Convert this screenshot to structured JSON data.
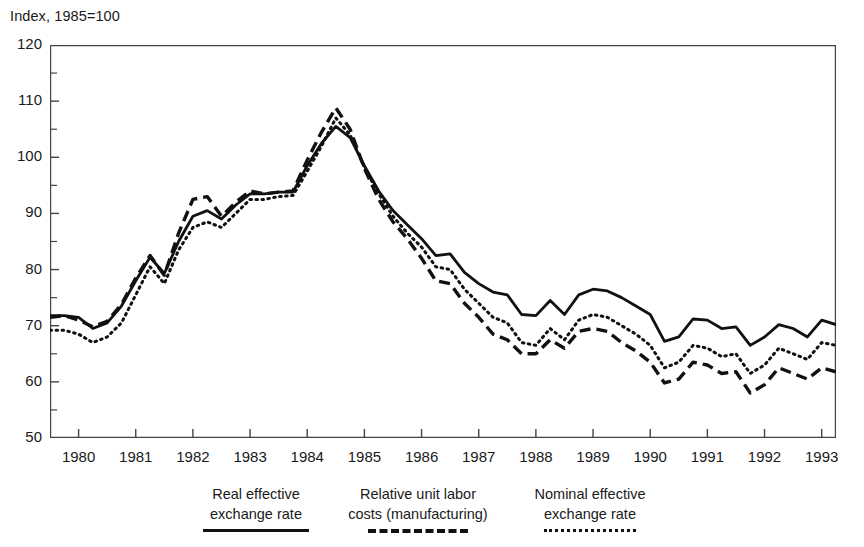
{
  "axis_title": "Index, 1985=100",
  "legend": [
    {
      "name": "real-effective-exchange-rate",
      "line1": "Real effective",
      "line2": "exchange rate",
      "style": "solid"
    },
    {
      "name": "relative-unit-labor-costs",
      "line1": "Relative unit labor",
      "line2": "costs (manufacturing)",
      "style": "dashed"
    },
    {
      "name": "nominal-effective-exchange-rate",
      "line1": "Nominal effective",
      "line2": "exchange rate",
      "style": "dotted"
    }
  ],
  "chart_data": {
    "type": "line",
    "title": "Index, 1985=100",
    "xlabel": "",
    "ylabel": "Index, 1985=100",
    "xlim": [
      1979.5,
      1993.25
    ],
    "ylim": [
      50,
      120
    ],
    "yticks": [
      50,
      60,
      70,
      80,
      90,
      100,
      110,
      120
    ],
    "yticks_minor": [
      55,
      65,
      75,
      85,
      95,
      105,
      115
    ],
    "xticks": [
      1980,
      1981,
      1982,
      1983,
      1984,
      1985,
      1986,
      1987,
      1988,
      1989,
      1990,
      1991,
      1992,
      1993
    ],
    "grid": false,
    "legend_position": "below",
    "frequency": "quarterly",
    "x": [
      1979.5,
      1979.75,
      1980.0,
      1980.25,
      1980.5,
      1980.75,
      1981.0,
      1981.25,
      1981.5,
      1981.75,
      1982.0,
      1982.25,
      1982.5,
      1982.75,
      1983.0,
      1983.25,
      1983.5,
      1983.75,
      1984.0,
      1984.25,
      1984.5,
      1984.75,
      1985.0,
      1985.25,
      1985.5,
      1985.75,
      1986.0,
      1986.25,
      1986.5,
      1986.75,
      1987.0,
      1987.25,
      1987.5,
      1987.75,
      1988.0,
      1988.25,
      1988.5,
      1988.75,
      1989.0,
      1989.25,
      1989.5,
      1989.75,
      1990.0,
      1990.25,
      1990.5,
      1990.75,
      1991.0,
      1991.25,
      1991.5,
      1991.75,
      1992.0,
      1992.25,
      1992.5,
      1992.75,
      1993.0,
      1993.25
    ],
    "series": [
      {
        "name": "Real effective exchange rate",
        "style": "solid",
        "color": "#111111",
        "values": [
          71.8,
          71.8,
          71.5,
          69.5,
          70.5,
          73.5,
          78.0,
          82.2,
          79.3,
          85.0,
          89.5,
          90.5,
          89.0,
          91.5,
          93.5,
          93.5,
          93.8,
          93.8,
          98.5,
          102.5,
          105.5,
          103.5,
          98.5,
          94.0,
          90.5,
          88.0,
          85.5,
          82.5,
          82.8,
          79.5,
          77.5,
          76.0,
          75.5,
          72.0,
          71.8,
          74.5,
          72.0,
          75.5,
          76.5,
          76.2,
          75.0,
          73.5,
          72.0,
          67.2,
          68.0,
          71.2,
          71.0,
          69.5,
          69.8,
          66.5,
          68.0,
          70.2,
          69.5,
          68.0,
          71.0,
          70.2
        ]
      },
      {
        "name": "Relative unit labor costs (manufacturing)",
        "style": "dashed",
        "color": "#111111",
        "values": [
          71.5,
          71.8,
          71.0,
          69.8,
          70.8,
          73.8,
          78.5,
          82.5,
          79.0,
          86.5,
          92.5,
          93.0,
          89.5,
          92.0,
          94.0,
          93.5,
          93.8,
          94.0,
          99.5,
          104.5,
          108.8,
          105.0,
          98.0,
          92.5,
          88.5,
          85.5,
          82.0,
          78.0,
          77.5,
          74.0,
          71.5,
          68.5,
          67.5,
          65.0,
          65.0,
          67.5,
          66.0,
          69.0,
          69.5,
          69.0,
          67.0,
          65.5,
          63.5,
          59.8,
          60.5,
          63.5,
          63.0,
          61.5,
          61.8,
          58.0,
          59.5,
          62.5,
          61.5,
          60.5,
          62.5,
          61.8
        ]
      },
      {
        "name": "Nominal effective exchange rate",
        "style": "dotted",
        "color": "#111111",
        "values": [
          69.2,
          69.2,
          68.5,
          67.0,
          68.0,
          70.5,
          75.5,
          80.5,
          77.5,
          83.5,
          87.5,
          88.5,
          87.5,
          90.0,
          92.5,
          92.5,
          93.0,
          93.2,
          97.5,
          102.0,
          107.0,
          104.0,
          98.2,
          93.5,
          89.5,
          86.5,
          84.0,
          80.5,
          80.0,
          76.5,
          74.0,
          71.5,
          70.5,
          67.0,
          66.5,
          69.5,
          67.5,
          71.0,
          72.0,
          71.5,
          70.0,
          68.5,
          66.5,
          62.5,
          63.5,
          66.5,
          66.0,
          64.5,
          65.0,
          61.5,
          63.0,
          66.0,
          65.0,
          64.0,
          67.0,
          66.5
        ]
      }
    ]
  }
}
